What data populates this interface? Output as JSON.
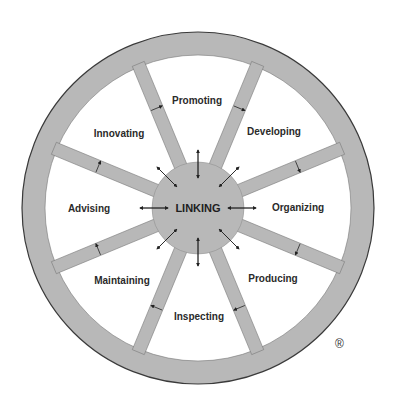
{
  "diagram": {
    "type": "wheel",
    "hub_label": "LINKING",
    "sectors": [
      {
        "label": "Promoting",
        "angle": 0
      },
      {
        "label": "Developing",
        "angle": 45
      },
      {
        "label": "Organizing",
        "angle": 90
      },
      {
        "label": "Producing",
        "angle": 135
      },
      {
        "label": "Inspecting",
        "angle": 180
      },
      {
        "label": "Maintaining",
        "angle": 225
      },
      {
        "label": "Advising",
        "angle": 270
      },
      {
        "label": "Innovating",
        "angle": 315
      }
    ],
    "registered_mark": "®",
    "colors": {
      "rim_fill": "#b8b8b8",
      "outline": "#3a3a3a",
      "sector_fill": "#ffffff",
      "text": "#2a2a2a"
    }
  }
}
